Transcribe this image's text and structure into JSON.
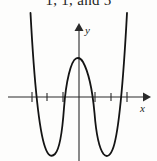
{
  "figure": {
    "caption_fragment": "1, 1, and 5",
    "axes": {
      "x_label": "x",
      "y_label": "y",
      "origin_px": [
        79,
        88
      ],
      "x_axis_y_px": 88,
      "y_axis_x_px": 79,
      "tick_spacing_px": 16,
      "x_ticks_px": [
        32,
        47,
        63,
        95,
        111,
        127
      ],
      "x_axis_extent_px": [
        8,
        149
      ],
      "y_axis_extent_px": [
        18,
        152
      ]
    },
    "curve": {
      "shape": "quartic-w",
      "stroke_color": "#141414",
      "stroke_width": 1.7,
      "local_max_px": [
        79,
        49
      ],
      "left_min_px": [
        52,
        146
      ],
      "right_min_px": [
        107,
        146
      ],
      "x_intercepts_px": [
        63,
        95
      ],
      "left_branch_top_px": [
        31,
        12
      ],
      "right_branch_top_px": [
        126,
        12
      ]
    },
    "colors": {
      "background": "#fdfdfc",
      "ink": "#1d1d1d",
      "curve": "#141414",
      "axis": "#2a2a2a"
    }
  }
}
